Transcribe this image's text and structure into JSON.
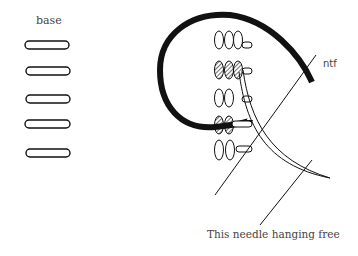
{
  "labels": {
    "base": "base",
    "ntf": "ntf",
    "caption": "This needle hanging free"
  },
  "base_ovals": {
    "count": 5,
    "items": [
      {
        "cx": 47,
        "cy": 45
      },
      {
        "cx": 48,
        "cy": 71
      },
      {
        "cx": 48,
        "cy": 99
      },
      {
        "cx": 48,
        "cy": 124
      },
      {
        "cx": 48,
        "cy": 153
      }
    ]
  },
  "colors": {
    "stroke": "#111111",
    "text": "#444444",
    "background": "#ffffff"
  }
}
